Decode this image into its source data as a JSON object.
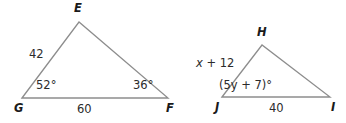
{
  "figure": {
    "stroke_color": "#8d8d8d",
    "text_color": "#231f20",
    "background": "#ffffff"
  },
  "triangles": [
    {
      "name": "triangle-EFG",
      "vertices": [
        {
          "label": "E",
          "x": 79,
          "y": 22
        },
        {
          "label": "F",
          "x": 168,
          "y": 98
        },
        {
          "label": "G",
          "x": 22,
          "y": 98
        }
      ],
      "vertex_labels": [
        {
          "name": "vertex-label-e",
          "text": "E",
          "x": 74,
          "y": 3
        },
        {
          "name": "vertex-label-f",
          "text": "F",
          "x": 166,
          "y": 103
        },
        {
          "name": "vertex-label-g",
          "text": "G",
          "x": 14,
          "y": 103
        }
      ],
      "side_labels": [
        {
          "name": "side-label-ge",
          "text": "42",
          "x": 29,
          "y": 49
        },
        {
          "name": "side-label-gf",
          "text": "60",
          "x": 77,
          "y": 104
        }
      ],
      "angle_labels": [
        {
          "name": "angle-label-g",
          "text": "52°",
          "x": 36,
          "y": 80
        },
        {
          "name": "angle-label-f",
          "text": "36°",
          "x": 133,
          "y": 80
        }
      ]
    },
    {
      "name": "triangle-HIJ",
      "vertices": [
        {
          "label": "H",
          "x": 262,
          "y": 45
        },
        {
          "label": "I",
          "x": 330,
          "y": 97
        },
        {
          "label": "J",
          "x": 222,
          "y": 97
        }
      ],
      "vertex_labels": [
        {
          "name": "vertex-label-h",
          "text": "H",
          "x": 257,
          "y": 27
        },
        {
          "name": "vertex-label-i",
          "text": "I",
          "x": 331,
          "y": 102
        },
        {
          "name": "vertex-label-j",
          "text": "J",
          "x": 215,
          "y": 102
        }
      ],
      "side_labels": [
        {
          "name": "side-label-jh",
          "text": "x + 12",
          "x": 196,
          "y": 58
        },
        {
          "name": "side-label-ji",
          "text": "40",
          "x": 269,
          "y": 103
        }
      ],
      "angle_labels": [
        {
          "name": "angle-label-j",
          "text": "(5y + 7)°",
          "x": 219,
          "y": 80
        }
      ]
    }
  ]
}
